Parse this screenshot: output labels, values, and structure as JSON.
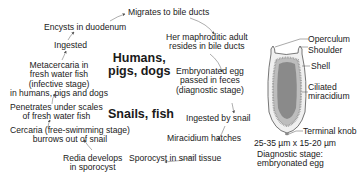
{
  "cycle": {
    "steps": [
      {
        "id": "migrates",
        "text": "Migrates to bile ducts"
      },
      {
        "id": "adult_l1",
        "text": "Her maphroditic adult"
      },
      {
        "id": "adult_l2",
        "text": "resides in bile ducts"
      },
      {
        "id": "egg_l1",
        "text": "Embryonated egg"
      },
      {
        "id": "egg_l2",
        "text": "passed in feces"
      },
      {
        "id": "egg_l3",
        "text": "(diagnostic stage)"
      },
      {
        "id": "ingested_snail",
        "text": "Ingested by snail"
      },
      {
        "id": "miracidium",
        "text": "Miracidium hatches"
      },
      {
        "id": "sporocyst",
        "text": "Sporocyst in snail tissue"
      },
      {
        "id": "redia_l1",
        "text": "Redia develops"
      },
      {
        "id": "redia_l2",
        "text": "in sporocyst"
      },
      {
        "id": "cercaria_l1",
        "text": "Cercaria (free-swimming stage)"
      },
      {
        "id": "cercaria_l2",
        "text": "burrows out of snail"
      },
      {
        "id": "penetrates_l1",
        "text": "Penetrates under scales"
      },
      {
        "id": "penetrates_l2",
        "text": "of fresh water fish"
      },
      {
        "id": "meta_l1",
        "text": "Metacercaria in"
      },
      {
        "id": "meta_l2",
        "text": "fresh water fish"
      },
      {
        "id": "meta_l3",
        "text": "(infective stage)"
      },
      {
        "id": "meta_l4",
        "text": "in humans, pigs and dogs"
      },
      {
        "id": "ingested",
        "text": "Ingested"
      },
      {
        "id": "encysts",
        "text": "Encysts in duodenum"
      }
    ],
    "hosts": {
      "definitive_l1": "Humans,",
      "definitive_l2": "pigs, dogs",
      "intermediate": "Snails, fish"
    }
  },
  "egg": {
    "labels": {
      "operculum": "Operculum",
      "shoulder": "Shoulder",
      "shell": "Shell",
      "ciliated_l1": "Ciliated",
      "ciliated_l2": "miracidium",
      "terminal_knob": "Terminal knob"
    },
    "size": "25-35 µm x 15-20 µm",
    "diagnostic_l1": "Diagnostic stage:",
    "diagnostic_l2": "embryonated egg"
  }
}
